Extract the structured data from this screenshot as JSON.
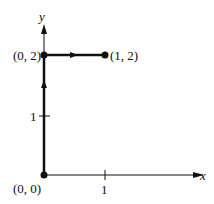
{
  "diagram": {
    "axes": {
      "x_label": "x",
      "y_label": "y",
      "x_tick": "1",
      "y_tick": "1"
    },
    "points": [
      {
        "label": "(0, 0)",
        "x": 0,
        "y": 0
      },
      {
        "label": "(0, 2)",
        "x": 0,
        "y": 2
      },
      {
        "label": "(1, 2)",
        "x": 1,
        "y": 2
      }
    ],
    "path": [
      {
        "from": "(0, 0)",
        "to": "(0, 2)",
        "direction": "up"
      },
      {
        "from": "(0, 2)",
        "to": "(1, 2)",
        "direction": "right"
      }
    ]
  }
}
